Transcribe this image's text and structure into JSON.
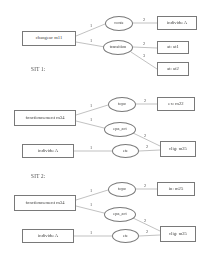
{
  "diagram": {
    "type": "graph",
    "title": "",
    "sections": [
      {
        "id": "top",
        "label": "",
        "nodes": [
          {
            "id": "changeur",
            "shape": "box",
            "label": "changeur m11"
          },
          {
            "id": "conte",
            "shape": "oval",
            "label": "conte"
          },
          {
            "id": "transition",
            "shape": "oval",
            "label": "transition"
          },
          {
            "id": "individu_a",
            "shape": "box",
            "label": "individu A"
          },
          {
            "id": "at1",
            "shape": "box",
            "label": "at: at1"
          },
          {
            "id": "at2",
            "shape": "box",
            "label": "at: at2"
          }
        ],
        "edges": [
          {
            "from": "changeur",
            "to": "conte",
            "label": "1"
          },
          {
            "from": "changeur",
            "to": "transition",
            "label": "1"
          },
          {
            "from": "conte",
            "to": "individu_a",
            "label": "2"
          },
          {
            "from": "transition",
            "to": "at1",
            "label": "2"
          },
          {
            "from": "transition",
            "to": "at2",
            "label": "3"
          }
        ]
      },
      {
        "id": "sit1",
        "label": "SIT 1:",
        "nodes": [
          {
            "id": "fonctionnement",
            "shape": "box",
            "label": "fonctionnement m34"
          },
          {
            "id": "topo",
            "shape": "oval",
            "label": "topo"
          },
          {
            "id": "epa_act",
            "shape": "oval",
            "label": "epa_act"
          },
          {
            "id": "individu_a",
            "shape": "box",
            "label": "individu A"
          },
          {
            "id": "ete",
            "shape": "oval",
            "label": "ete"
          },
          {
            "id": "ex",
            "shape": "box",
            "label": "ex: m22"
          },
          {
            "id": "clig",
            "shape": "box",
            "label": "clig: m25"
          }
        ],
        "edges": [
          {
            "from": "fonctionnement",
            "to": "topo",
            "label": "1"
          },
          {
            "from": "fonctionnement",
            "to": "epa_act",
            "label": "1"
          },
          {
            "from": "topo",
            "to": "ex",
            "label": "2"
          },
          {
            "from": "epa_act",
            "to": "clig",
            "label": "2"
          },
          {
            "from": "individu_a",
            "to": "ete",
            "label": "1"
          },
          {
            "from": "ete",
            "to": "clig",
            "label": "2"
          }
        ]
      },
      {
        "id": "sit2",
        "label": "SIT 2:",
        "nodes": [
          {
            "id": "fonctionnement",
            "shape": "box",
            "label": "fonctionnement m34"
          },
          {
            "id": "topo",
            "shape": "oval",
            "label": "topo"
          },
          {
            "id": "epa_act",
            "shape": "oval",
            "label": "epa_act"
          },
          {
            "id": "individu_a",
            "shape": "box",
            "label": "individu A"
          },
          {
            "id": "ete",
            "shape": "oval",
            "label": "ete"
          },
          {
            "id": "in",
            "shape": "box",
            "label": "in: m25"
          },
          {
            "id": "clig",
            "shape": "box",
            "label": "clig: m25"
          }
        ],
        "edges": [
          {
            "from": "fonctionnement",
            "to": "topo",
            "label": "1"
          },
          {
            "from": "fonctionnement",
            "to": "epa_act",
            "label": "1"
          },
          {
            "from": "topo",
            "to": "in",
            "label": "2"
          },
          {
            "from": "epa_act",
            "to": "clig",
            "label": "2"
          },
          {
            "from": "individu_a",
            "to": "ete",
            "label": "1"
          },
          {
            "from": "ete",
            "to": "clig",
            "label": "2"
          }
        ]
      }
    ]
  },
  "colors": {
    "stroke": "#6f6f6f",
    "text": "#30302f",
    "background": "#ffffff"
  }
}
